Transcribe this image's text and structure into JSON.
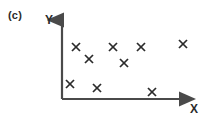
{
  "figure": {
    "panel_label": "(c)",
    "background_color": "#ffffff",
    "axis_color": "#4a4a4a",
    "marker_color": "#2b2b2b",
    "axes": {
      "x_label": "X",
      "y_label": "Y",
      "origin": {
        "x": 62,
        "y": 99
      },
      "x_axis_end": {
        "x": 200,
        "y": 99
      },
      "y_axis_end": {
        "x": 62,
        "y": 14
      },
      "arrowheads": true,
      "tick_marks": false,
      "tick_labels": false,
      "grid": false
    }
  },
  "chart_data": {
    "type": "scatter",
    "title": "(c)",
    "xlabel": "X",
    "ylabel": "Y",
    "grid": false,
    "legend": null,
    "marker": "x",
    "marker_color": "#2b2b2b",
    "axis_ranges_note": "Axes are unlabeled arrows with no numeric ticks; values below are read in pixel coordinates of the plot area.",
    "xlim": [
      62,
      200
    ],
    "ylim": [
      14,
      99
    ],
    "points_pixels": [
      {
        "x": 76,
        "y": 47
      },
      {
        "x": 89,
        "y": 59
      },
      {
        "x": 113,
        "y": 47
      },
      {
        "x": 124,
        "y": 63
      },
      {
        "x": 141,
        "y": 47
      },
      {
        "x": 183,
        "y": 44
      },
      {
        "x": 70,
        "y": 84
      },
      {
        "x": 97,
        "y": 88
      },
      {
        "x": 152,
        "y": 92
      }
    ],
    "x": [
      76,
      89,
      113,
      124,
      141,
      183,
      70,
      97,
      152
    ],
    "y": [
      47,
      59,
      47,
      63,
      47,
      44,
      84,
      88,
      92
    ],
    "n_points": 9
  }
}
